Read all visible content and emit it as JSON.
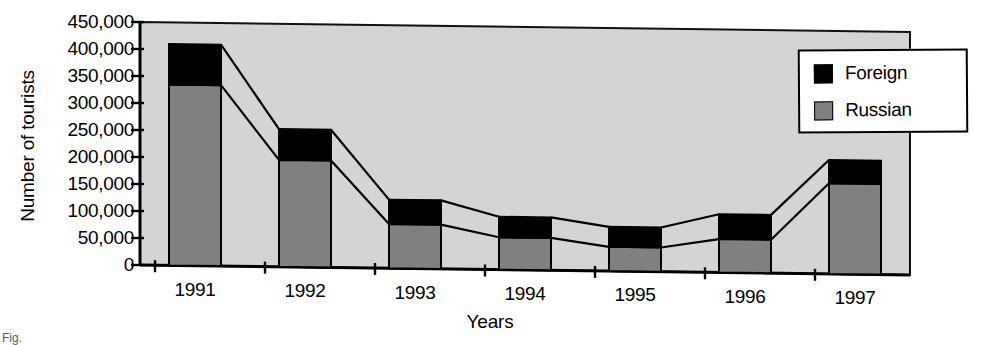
{
  "chart_data": {
    "type": "bar",
    "subtype": "stacked-bar",
    "title": "",
    "xlabel": "Years",
    "ylabel": "Number of tourists",
    "categories": [
      "1991",
      "1992",
      "1993",
      "1994",
      "1995",
      "1996",
      "1997"
    ],
    "series": [
      {
        "name": "Russian",
        "color": "#808080",
        "values": [
          335000,
          198000,
          82000,
          60000,
          45000,
          62000,
          168000
        ]
      },
      {
        "name": "Foreign",
        "color": "#000000",
        "values": [
          75000,
          57000,
          45000,
          38000,
          37000,
          46000,
          43000
        ]
      }
    ],
    "totals": [
      410000,
      255000,
      127000,
      98000,
      82000,
      108000,
      211000
    ],
    "ylim": [
      0,
      450000
    ],
    "yticks": [
      "0",
      "50,000",
      "100,000",
      "150,000",
      "200,000",
      "250,000",
      "300,000",
      "350,000",
      "400,000",
      "450,000"
    ],
    "ytick_values": [
      0,
      50000,
      100000,
      150000,
      200000,
      250000,
      300000,
      350000,
      400000,
      450000
    ],
    "grid": false,
    "legend_position": "top-right",
    "legend": [
      "Foreign",
      "Russian"
    ],
    "plot_background": "#d4d4d4",
    "has_connecting_lines": true
  },
  "axes": {
    "y_title": "Number of tourists",
    "x_title": "Years"
  },
  "legend": {
    "items": [
      {
        "label": "Foreign",
        "color": "#000000"
      },
      {
        "label": "Russian",
        "color": "#808080"
      }
    ]
  },
  "caption": "Fig."
}
